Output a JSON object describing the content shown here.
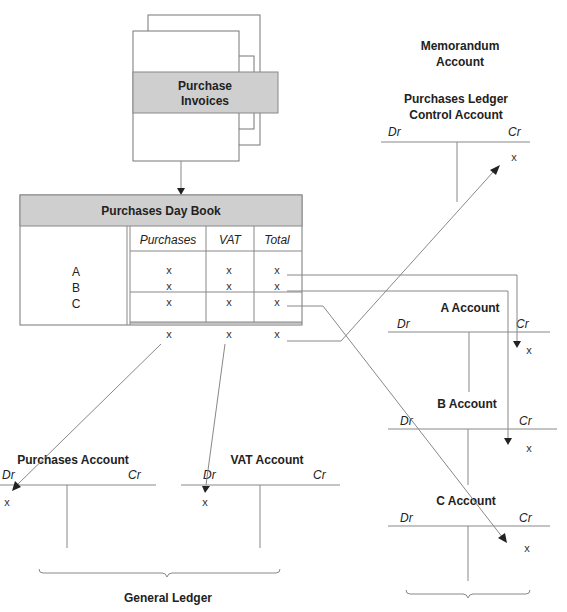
{
  "source_doc": {
    "title_line1": "Purchase",
    "title_line2": "Invoices"
  },
  "day_book": {
    "title": "Purchases Day Book",
    "columns": [
      "Purchases",
      "VAT",
      "Total"
    ],
    "rows": [
      {
        "name": "A",
        "values": [
          "x",
          "x",
          "x"
        ]
      },
      {
        "name": "B",
        "values": [
          "x",
          "x",
          "x"
        ]
      },
      {
        "name": "C",
        "values": [
          "x",
          "x",
          "x"
        ]
      }
    ],
    "totals": [
      "x",
      "x",
      "x"
    ]
  },
  "memorandum": {
    "heading_line1": "Memorandum",
    "heading_line2": "Account",
    "control_account": {
      "title_line1": "Purchases Ledger",
      "title_line2": "Control Account",
      "dr": "Dr",
      "cr": "Cr",
      "cr_entry": "x"
    }
  },
  "personal_accounts": [
    {
      "title": "A Account",
      "dr": "Dr",
      "cr": "Cr",
      "cr_entry": "x"
    },
    {
      "title": "B Account",
      "dr": "Dr",
      "cr": "Cr",
      "cr_entry": "x"
    },
    {
      "title": "C Account",
      "dr": "Dr",
      "cr": "Cr",
      "cr_entry": "x"
    }
  ],
  "general_ledger": {
    "label": "General Ledger",
    "accounts": [
      {
        "title": "Purchases Account",
        "dr": "Dr",
        "cr": "Cr",
        "dr_entry": "x"
      },
      {
        "title": "VAT Account",
        "dr": "Dr",
        "cr": "Cr",
        "dr_entry": "x"
      }
    ]
  }
}
